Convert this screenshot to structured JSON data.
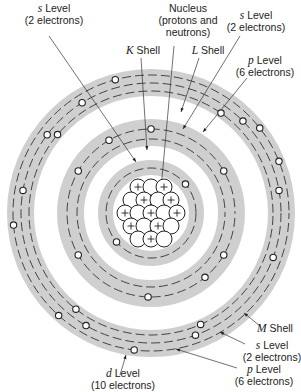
{
  "diagram": {
    "center": [
      151,
      213
    ],
    "colors": {
      "band": "#cfcfcf",
      "line": "#333333",
      "electron_fill": "#ffffff",
      "background": "#ffffff"
    },
    "nucleus": {
      "label_line1": "Nucleus",
      "label_line2": "(protons and",
      "label_line3": "neutrons)",
      "particle_radius": 8,
      "particles": [
        {
          "x": -13,
          "y": -26,
          "p": true
        },
        {
          "x": 0,
          "y": -26,
          "p": false
        },
        {
          "x": 13,
          "y": -26,
          "p": true
        },
        {
          "x": -20,
          "y": -13,
          "p": false
        },
        {
          "x": -7,
          "y": -13,
          "p": true
        },
        {
          "x": 7,
          "y": -13,
          "p": false
        },
        {
          "x": 20,
          "y": -13,
          "p": true
        },
        {
          "x": -26,
          "y": 0,
          "p": true
        },
        {
          "x": -13,
          "y": 0,
          "p": false
        },
        {
          "x": 0,
          "y": 0,
          "p": true
        },
        {
          "x": 13,
          "y": 0,
          "p": false
        },
        {
          "x": 26,
          "y": 0,
          "p": true
        },
        {
          "x": -20,
          "y": 13,
          "p": true
        },
        {
          "x": -7,
          "y": 13,
          "p": false
        },
        {
          "x": 7,
          "y": 13,
          "p": true
        },
        {
          "x": 20,
          "y": 13,
          "p": false
        },
        {
          "x": -13,
          "y": 26,
          "p": false
        },
        {
          "x": 0,
          "y": 26,
          "p": true
        },
        {
          "x": 13,
          "y": 26,
          "p": false
        }
      ]
    },
    "shells": [
      {
        "name": "K Shell",
        "letter": "K",
        "suffix": " Shell",
        "inner": 38,
        "outer": 53,
        "levels": [
          {
            "name": "s",
            "radius": 45,
            "electrons": 2
          }
        ],
        "electron_positions": [
          {
            "r": 45,
            "deg": 220
          },
          {
            "r": 45,
            "deg": 40
          }
        ]
      },
      {
        "name": "L Shell",
        "letter": "L",
        "suffix": " Shell",
        "inner": 67,
        "outer": 94,
        "levels": [
          {
            "name": "s",
            "radius": 74,
            "electrons": 2
          },
          {
            "name": "p",
            "radius": 84,
            "electrons": 6
          }
        ],
        "electron_positions": [
          {
            "r": 84,
            "deg": 268
          },
          {
            "r": 84,
            "deg": 310
          },
          {
            "r": 84,
            "deg": 150
          },
          {
            "r": 84,
            "deg": 30
          },
          {
            "r": 84,
            "deg": 210
          },
          {
            "r": 84,
            "deg": 330
          },
          {
            "r": 84,
            "deg": 90
          },
          {
            "r": 84,
            "deg": 120
          }
        ]
      },
      {
        "name": "M Shell",
        "letter": "M",
        "suffix": " Shell",
        "inner": 117,
        "outer": 144,
        "levels": [
          {
            "name": "s",
            "radius": 122,
            "electrons": 2
          },
          {
            "name": "p",
            "radius": 130,
            "electrons": 6
          },
          {
            "name": "d",
            "radius": 138,
            "electrons": 10
          }
        ],
        "electron_positions": [
          {
            "r": 138,
            "deg": 263
          },
          {
            "r": 130,
            "deg": 240
          },
          {
            "r": 122,
            "deg": 232
          },
          {
            "r": 138,
            "deg": 228
          },
          {
            "r": 130,
            "deg": 290
          },
          {
            "r": 122,
            "deg": 294
          },
          {
            "r": 130,
            "deg": 340
          },
          {
            "r": 138,
            "deg": 185
          },
          {
            "r": 130,
            "deg": 170
          },
          {
            "r": 130,
            "deg": 10
          },
          {
            "r": 138,
            "deg": 22
          },
          {
            "r": 130,
            "deg": 143
          },
          {
            "r": 130,
            "deg": 45
          },
          {
            "r": 138,
            "deg": 38
          },
          {
            "r": 122,
            "deg": 55
          },
          {
            "r": 130,
            "deg": 122
          },
          {
            "r": 138,
            "deg": 105
          },
          {
            "r": 122,
            "deg": 140
          }
        ]
      }
    ]
  },
  "labels": {
    "nucleus": {
      "line1": "Nucleus",
      "line2": "(protons and",
      "line3": "neutrons)"
    },
    "k_s_level": {
      "letter": "s",
      "text": " Level",
      "sub": "(2 electrons)"
    },
    "k_shell": {
      "letter": "K",
      "text": " Shell"
    },
    "l_shell": {
      "letter": "L",
      "text": " Shell"
    },
    "l_s_level": {
      "letter": "s",
      "text": " Level",
      "sub": "(2 electrons)"
    },
    "l_p_level": {
      "letter": "p",
      "text": " Level",
      "sub": "(6 electrons)"
    },
    "m_shell": {
      "letter": "M",
      "text": " Shell"
    },
    "m_s_level": {
      "letter": "s",
      "text": " Level",
      "sub": "(2 electrons)"
    },
    "m_p_level": {
      "letter": "p",
      "text": " Level",
      "sub": "(6 electrons)"
    },
    "m_d_level": {
      "letter": "d",
      "text": " Level",
      "sub": "(10 electrons)"
    }
  },
  "leaders": [
    {
      "from": [
        49,
        36
      ],
      "to": [
        136,
        162
      ]
    },
    {
      "from": [
        141,
        58
      ],
      "to": [
        147,
        150
      ]
    },
    {
      "from": [
        174,
        46
      ],
      "to": [
        161,
        189
      ]
    },
    {
      "from": [
        199,
        58
      ],
      "to": [
        181,
        112
      ]
    },
    {
      "from": [
        240,
        36
      ],
      "to": [
        183,
        129
      ]
    },
    {
      "from": [
        247,
        78
      ],
      "to": [
        203,
        132
      ]
    },
    {
      "from": [
        260,
        326
      ],
      "to": [
        244,
        313
      ]
    },
    {
      "from": [
        245,
        344
      ],
      "to": [
        220,
        332
      ]
    },
    {
      "from": [
        237,
        368
      ],
      "to": [
        176,
        349
      ]
    },
    {
      "from": [
        120,
        375
      ],
      "to": [
        126,
        355
      ]
    }
  ]
}
